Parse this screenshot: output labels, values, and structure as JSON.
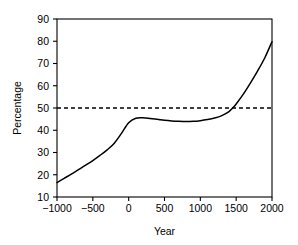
{
  "chart_data": {
    "type": "line",
    "title": "",
    "subtitle": "",
    "xlabel": "Year",
    "ylabel": "Percentage",
    "xlim": [
      -1000,
      2000
    ],
    "ylim": [
      10,
      90
    ],
    "xticks": [
      -1000,
      -500,
      0,
      500,
      1000,
      1500,
      2000
    ],
    "xtick_labels": [
      "−1000",
      "−500",
      "0",
      "500",
      "1000",
      "1500",
      "2000"
    ],
    "yticks": [
      10,
      20,
      30,
      40,
      50,
      60,
      70,
      80,
      90
    ],
    "ytick_labels": [
      "10",
      "20",
      "30",
      "40",
      "50",
      "60",
      "70",
      "80",
      "90"
    ],
    "grid": false,
    "legend": null,
    "legend_position": "none",
    "frame": "box",
    "series": [
      {
        "name": "Percentage",
        "style": "solid",
        "color": "#000000",
        "x": [
          -1000,
          -900,
          -800,
          -700,
          -600,
          -500,
          -400,
          -300,
          -200,
          -100,
          0,
          100,
          200,
          300,
          400,
          500,
          600,
          700,
          800,
          900,
          1000,
          1100,
          1200,
          1300,
          1400,
          1450,
          1500,
          1600,
          1700,
          1800,
          1900,
          2000
        ],
        "y": [
          16.5,
          18.4,
          20.3,
          22.3,
          24.3,
          26.4,
          28.7,
          31.2,
          34.2,
          38.6,
          43.4,
          45.4,
          45.6,
          45.3,
          44.9,
          44.5,
          44.2,
          44.0,
          43.9,
          44.0,
          44.3,
          44.8,
          45.5,
          46.6,
          48.4,
          50.0,
          51.8,
          56.2,
          61.3,
          66.7,
          72.6,
          79.8
        ]
      },
      {
        "name": "50 percent reference",
        "style": "dashed",
        "color": "#000000",
        "x": [
          -1000,
          2000
        ],
        "y": [
          50,
          50
        ]
      }
    ],
    "annotations": [],
    "reference_lines": [
      {
        "axis": "y",
        "value": 50,
        "style": "dashed"
      }
    ]
  }
}
